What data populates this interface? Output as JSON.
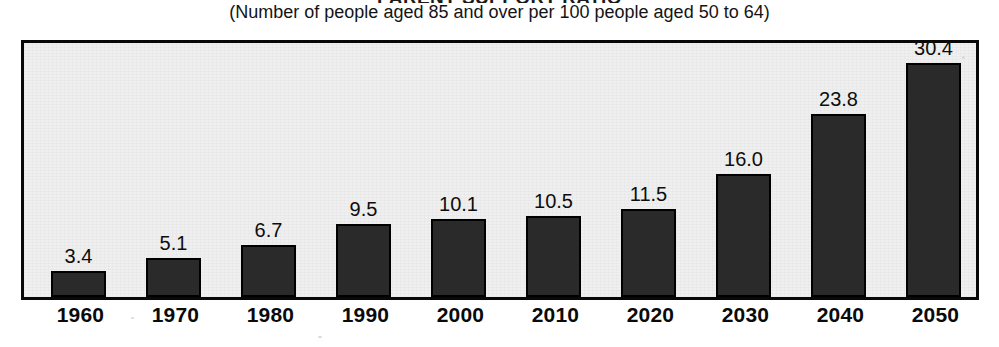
{
  "figure": {
    "title": "PARENT SUPPORT RATIO",
    "subtitle": "(Number of people aged 85 and over per 100 people aged 50 to 64)"
  },
  "chart_data": {
    "type": "bar",
    "title": "PARENT SUPPORT RATIO",
    "subtitle": "(Number of people aged 85 and over per 100 people aged 50 to 64)",
    "xlabel": "",
    "ylabel": "",
    "ylim": [
      0,
      33
    ],
    "grid": false,
    "legend": false,
    "bar_color": "#2a2a2a",
    "plot_background": "#efefef",
    "categories": [
      "1960",
      "1970",
      "1980",
      "1990",
      "2000",
      "2010",
      "2020",
      "2030",
      "2040",
      "2050"
    ],
    "values": [
      3.4,
      5.1,
      6.7,
      9.5,
      10.1,
      10.5,
      11.5,
      16.0,
      23.8,
      30.4
    ],
    "data_labels": [
      "3.4",
      "5.1",
      "6.7",
      "9.5",
      "10.1",
      "10.5",
      "11.5",
      "16.0",
      "23.8",
      "30.4"
    ],
    "tick_labels": [
      "1960",
      "1970",
      "1980",
      "1990",
      "2000",
      "2010",
      "2020",
      "2030",
      "2040",
      "2050"
    ]
  }
}
